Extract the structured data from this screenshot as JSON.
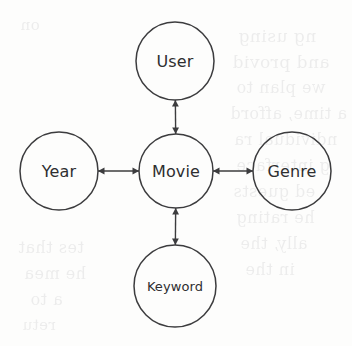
{
  "diagram": {
    "type": "star-schema-graph",
    "background_color": "#fdfdfc",
    "stroke_color": "#3c3c3e",
    "text_color": "#2e2e30",
    "nodes": [
      {
        "id": "user",
        "label": "User",
        "cx": 175,
        "cy": 61,
        "r": 39,
        "font_size": 16
      },
      {
        "id": "year",
        "label": "Year",
        "cx": 59,
        "cy": 171,
        "r": 39,
        "font_size": 16
      },
      {
        "id": "movie",
        "label": "Movie",
        "cx": 176,
        "cy": 171,
        "r": 37,
        "font_size": 16
      },
      {
        "id": "genre",
        "label": "Genre",
        "cx": 292,
        "cy": 171,
        "r": 39,
        "font_size": 16
      },
      {
        "id": "keyword",
        "label": "Keyword",
        "cx": 175,
        "cy": 286,
        "r": 41,
        "font_size": 13
      }
    ],
    "edges": [
      {
        "id": "movie-user",
        "from": "movie",
        "to": "user",
        "arrow": "both",
        "orientation": "vertical"
      },
      {
        "id": "movie-year",
        "from": "movie",
        "to": "year",
        "arrow": "both",
        "orientation": "horizontal"
      },
      {
        "id": "movie-genre",
        "from": "movie",
        "to": "genre",
        "arrow": "both",
        "orientation": "horizontal"
      },
      {
        "id": "movie-keyword",
        "from": "movie",
        "to": "keyword",
        "arrow": "both",
        "orientation": "vertical"
      }
    ],
    "bleed_through": [
      {
        "text": "ng using",
        "x": 238,
        "y": 26,
        "size": 17
      },
      {
        "text": "and  provid",
        "x": 232,
        "y": 52,
        "size": 17
      },
      {
        "text": "we plan to",
        "x": 236,
        "y": 78,
        "size": 16
      },
      {
        "text": "a time, afford",
        "x": 230,
        "y": 104,
        "size": 16
      },
      {
        "text": "ndividual ra",
        "x": 234,
        "y": 130,
        "size": 16
      },
      {
        "text": "g interface",
        "x": 236,
        "y": 156,
        "size": 16
      },
      {
        "text": "ed guests",
        "x": 233,
        "y": 182,
        "size": 16
      },
      {
        "text": "he rating",
        "x": 236,
        "y": 208,
        "size": 16
      },
      {
        "text": "ally, the",
        "x": 240,
        "y": 234,
        "size": 16
      },
      {
        "text": "in the",
        "x": 245,
        "y": 260,
        "size": 16
      },
      {
        "text": "tes that",
        "x": 18,
        "y": 238,
        "size": 16
      },
      {
        "text": "he mea",
        "x": 24,
        "y": 264,
        "size": 16
      },
      {
        "text": "a to",
        "x": 30,
        "y": 290,
        "size": 16
      },
      {
        "text": "retu",
        "x": 22,
        "y": 316,
        "size": 15
      },
      {
        "text": "on",
        "x": 20,
        "y": 16,
        "size": 15
      }
    ]
  }
}
